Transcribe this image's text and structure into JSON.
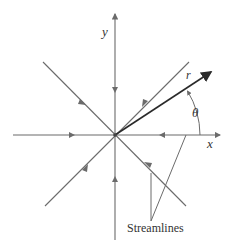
{
  "diagram": {
    "type": "sink flow streamlines",
    "labels": {
      "y_axis": "y",
      "x_axis": "x",
      "radius": "r",
      "angle": "θ",
      "streamlines": "Streamlines"
    },
    "colors": {
      "streamline": "#6b6b6b",
      "radius_vector": "#2a2a2a",
      "text": "#333333"
    }
  }
}
